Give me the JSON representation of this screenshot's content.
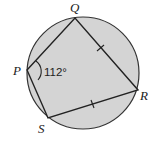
{
  "diagram": {
    "type": "cyclic-quadrilateral",
    "circle": {
      "cx": 83,
      "cy": 73,
      "r": 56,
      "fill": "#d4d4d4",
      "stroke": "#333333"
    },
    "vertices": {
      "Q": {
        "x": 75,
        "y": 18,
        "label": "Q",
        "lx": 70,
        "ly": 12
      },
      "P": {
        "x": 27,
        "y": 70,
        "label": "P",
        "lx": 14,
        "ly": 75
      },
      "R": {
        "x": 138,
        "y": 90,
        "label": "R",
        "lx": 140,
        "ly": 100
      },
      "S": {
        "x": 48,
        "y": 118,
        "label": "S",
        "lx": 38,
        "ly": 133
      }
    },
    "edges": [
      "PQ",
      "QR",
      "RS",
      "SP"
    ],
    "equal_marks": [
      "QR",
      "RS"
    ],
    "angle": {
      "vertex": "P",
      "text": "112°",
      "x": 44,
      "y": 76
    }
  }
}
